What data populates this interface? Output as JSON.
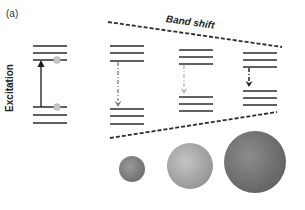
{
  "figure": {
    "panel_label": "(a)",
    "excitation_label": "Excitation",
    "band_shift_label": "Band shift",
    "colors": {
      "line": "#2b2b2b",
      "dashed": "#2b2b2b",
      "arrow_dark": "#1a1a1a",
      "arrow_mid": "#7a7a7a",
      "arrow_light": "#b5b5b5",
      "electron": "#c8c8c8"
    },
    "levels": [
      {
        "name": "ground-diagram",
        "x1": 33,
        "x2": 67,
        "upper": [
          46,
          53,
          60
        ],
        "lower": [
          107,
          115,
          123
        ]
      },
      {
        "name": "small-particle",
        "x1": 110,
        "x2": 144,
        "upper": [
          46,
          53,
          61
        ],
        "lower": [
          109,
          116,
          124
        ]
      },
      {
        "name": "medium-particle",
        "x1": 179,
        "x2": 213,
        "upper": [
          50,
          57,
          64
        ],
        "lower": [
          97,
          104,
          111
        ]
      },
      {
        "name": "large-particle",
        "x1": 243,
        "x2": 277,
        "upper": [
          53,
          60,
          67
        ],
        "lower": [
          91,
          98,
          105
        ]
      }
    ],
    "spheres": [
      {
        "name": "small-sphere",
        "cx": 132,
        "cy": 169,
        "r": 13,
        "fill": "#8a8a8a"
      },
      {
        "name": "medium-sphere",
        "cx": 190,
        "cy": 166,
        "r": 23,
        "fill": "#b0b0b0"
      },
      {
        "name": "large-sphere",
        "cx": 255,
        "cy": 162,
        "r": 31,
        "fill": "#7c7c7c"
      }
    ]
  }
}
